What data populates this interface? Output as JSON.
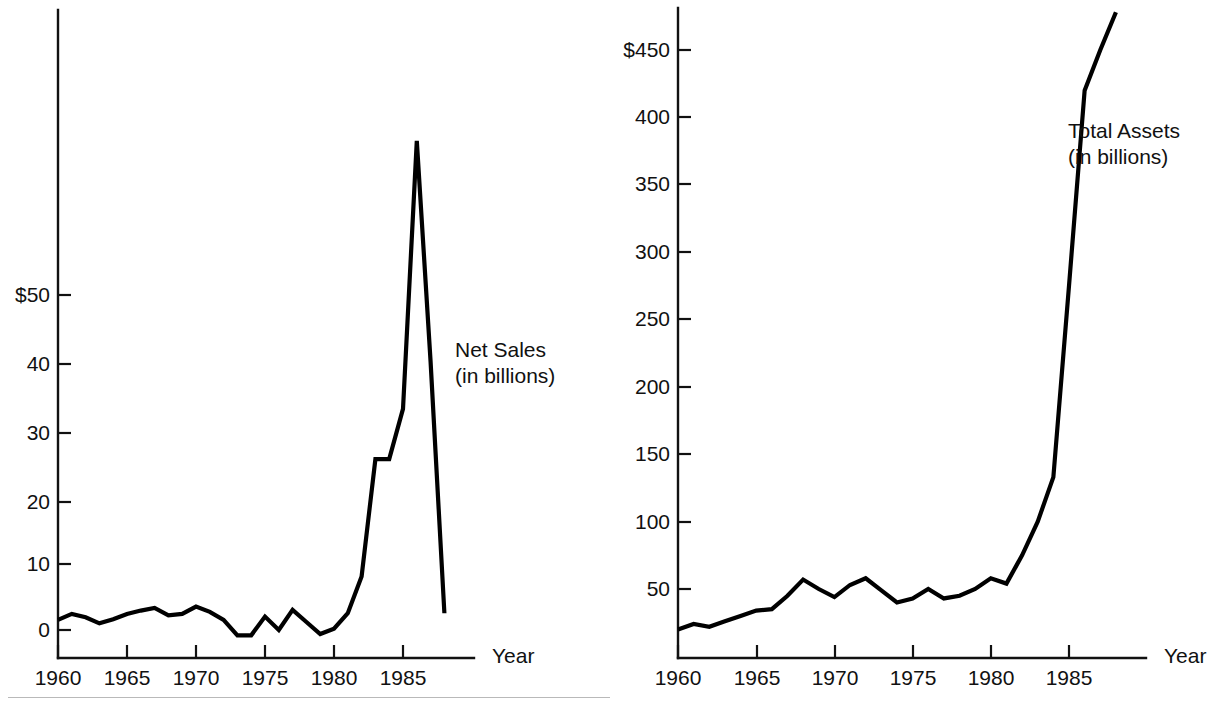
{
  "figure": {
    "background_color": "#ffffff",
    "line_color": "#000000",
    "panel_count": 2
  },
  "panels": [
    {
      "id": "net-sales",
      "series_label_line1": "Net Sales",
      "series_label_line2": "(in billions)",
      "x_axis_name": "Year",
      "y_tick_labels": [
        "$50",
        "40",
        "30",
        "20",
        "10",
        "0"
      ],
      "x_tick_labels": [
        "1960",
        "1965",
        "1970",
        "1975",
        "1980",
        "1985"
      ]
    },
    {
      "id": "total-assets",
      "series_label_line1": "Total Assets",
      "series_label_line2": "(in billions)",
      "x_axis_name": "Year",
      "y_tick_labels": [
        "$450",
        "400",
        "350",
        "300",
        "250",
        "200",
        "150",
        "100",
        "50"
      ],
      "x_tick_labels": [
        "1960",
        "1965",
        "1970",
        "1975",
        "1980",
        "1985"
      ]
    }
  ],
  "chart_data": [
    {
      "type": "line",
      "title": "Net Sales (in billions)",
      "xlabel": "Year",
      "ylabel": "",
      "grid": false,
      "legend": "inline-annotation",
      "xlim": [
        1960,
        1988
      ],
      "ylim": [
        -2,
        80
      ],
      "xticks": [
        1960,
        1965,
        1970,
        1975,
        1980,
        1985
      ],
      "yticks": [
        0,
        10,
        20,
        30,
        40,
        50
      ],
      "ytick_labels": [
        "0",
        "10",
        "20",
        "30",
        "40",
        "$50"
      ],
      "x": [
        1960,
        1961,
        1962,
        1963,
        1964,
        1965,
        1966,
        1967,
        1968,
        1969,
        1970,
        1971,
        1972,
        1973,
        1974,
        1975,
        1976,
        1977,
        1978,
        1979,
        1980,
        1981,
        1982,
        1983,
        1984,
        1985,
        1986,
        1987,
        1988
      ],
      "values": [
        1.5,
        2.4,
        1.9,
        1.0,
        1.6,
        2.4,
        2.9,
        3.3,
        2.2,
        2.4,
        3.5,
        2.7,
        1.5,
        -0.8,
        -0.8,
        2.0,
        0.0,
        3.0,
        1.2,
        -0.6,
        0.2,
        2.5,
        8.0,
        25.5,
        25.5,
        33.0,
        73.0,
        40.0,
        2.5
      ],
      "series": [
        {
          "name": "Net Sales",
          "unit": "billions of dollars",
          "values": [
            1.5,
            2.4,
            1.9,
            1.0,
            1.6,
            2.4,
            2.9,
            3.3,
            2.2,
            2.4,
            3.5,
            2.7,
            1.5,
            -0.8,
            -0.8,
            2.0,
            0.0,
            3.0,
            1.2,
            -0.6,
            0.2,
            2.5,
            8.0,
            25.5,
            25.5,
            33.0,
            73.0,
            40.0,
            2.5
          ]
        }
      ],
      "annotations": [
        {
          "text": "Net Sales (in billions)",
          "x": 1985.5,
          "y": 42
        }
      ]
    },
    {
      "type": "line",
      "title": "Total Assets (in billions)",
      "xlabel": "Year",
      "ylabel": "",
      "grid": false,
      "legend": "inline-annotation",
      "xlim": [
        1960,
        1988
      ],
      "ylim": [
        0,
        490
      ],
      "xticks": [
        1960,
        1965,
        1970,
        1975,
        1980,
        1985
      ],
      "yticks": [
        50,
        100,
        150,
        200,
        250,
        300,
        350,
        400,
        450
      ],
      "ytick_labels": [
        "50",
        "100",
        "150",
        "200",
        "250",
        "300",
        "350",
        "400",
        "$450"
      ],
      "x": [
        1960,
        1961,
        1962,
        1963,
        1964,
        1965,
        1966,
        1967,
        1968,
        1969,
        1970,
        1971,
        1972,
        1973,
        1974,
        1975,
        1976,
        1977,
        1978,
        1979,
        1980,
        1981,
        1982,
        1983,
        1984,
        1985,
        1986,
        1987,
        1988
      ],
      "values": [
        20,
        24,
        22,
        26,
        30,
        34,
        35,
        45,
        57,
        50,
        44,
        53,
        58,
        49,
        40,
        43,
        50,
        43,
        45,
        50,
        58,
        54,
        75,
        100,
        133,
        275,
        420,
        450,
        478
      ],
      "series": [
        {
          "name": "Total Assets",
          "unit": "billions of dollars",
          "values": [
            20,
            24,
            22,
            26,
            30,
            34,
            35,
            45,
            57,
            50,
            44,
            53,
            58,
            49,
            40,
            43,
            50,
            43,
            45,
            50,
            58,
            54,
            75,
            100,
            133,
            275,
            420,
            450,
            478
          ]
        }
      ],
      "annotations": [
        {
          "text": "Total Assets (in billions)",
          "x": 1985.5,
          "y": 390
        }
      ]
    }
  ]
}
